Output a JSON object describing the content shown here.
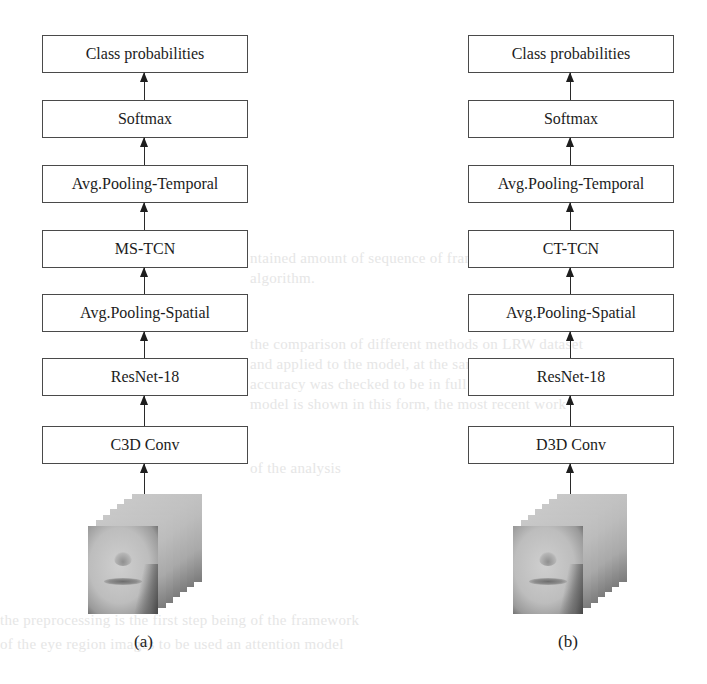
{
  "figure": {
    "panels": [
      {
        "id": "a",
        "caption": "(a)",
        "layers_top_to_bottom": [
          "Class probabilities",
          "Softmax",
          "Avg.Pooling-Temporal",
          "MS-TCN",
          "Avg.Pooling-Spatial",
          "ResNet-18",
          "C3D Conv"
        ],
        "input": "face-frame-stack"
      },
      {
        "id": "b",
        "caption": "(b)",
        "layers_top_to_bottom": [
          "Class probabilities",
          "Softmax",
          "Avg.Pooling-Temporal",
          "CT-TCN",
          "Avg.Pooling-Spatial",
          "ResNet-18",
          "D3D Conv"
        ],
        "input": "face-frame-stack"
      }
    ],
    "colors": {
      "box_border": "#4a4a4a",
      "text": "#1c1c1c",
      "arrow": "#1e1e1e",
      "background": "#ffffff"
    }
  }
}
